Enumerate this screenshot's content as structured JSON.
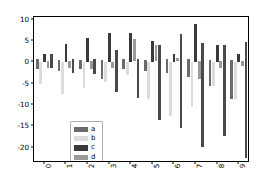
{
  "chart_data": {
    "type": "bar",
    "title": "",
    "xlabel": "",
    "ylabel": "",
    "categories": [
      "0",
      "1",
      "2",
      "3",
      "4",
      "5",
      "6",
      "7",
      "8",
      "9"
    ],
    "ylim": [
      -23.5,
      10.8
    ],
    "xlim": [
      -0.5,
      9.5
    ],
    "grid": false,
    "legend_position": "lower left",
    "y_ticks": [
      10,
      5,
      0,
      -5,
      -10,
      -15,
      -20
    ],
    "y_tick_labels": [
      "10",
      "5",
      "0",
      "-5",
      "-10",
      "-15",
      "-20"
    ],
    "x_ticks": [
      0,
      1,
      2,
      3,
      4,
      5,
      6,
      7,
      8,
      9
    ],
    "series": [
      {
        "name": "a",
        "color": "#6b6b6b",
        "values": [
          -1.5,
          -2.0,
          -1.5,
          -4.0,
          -1.5,
          -2.0,
          -2.5,
          -3.5,
          -5.5,
          -8.5
        ],
        "bases": [
          0.7,
          0.6,
          0.5,
          0.6,
          0.9,
          0.6,
          0.8,
          0.7,
          0.6,
          0.5
        ]
      },
      {
        "name": "b",
        "color": "#dcdcdc",
        "values": [
          -5.0,
          -7.5,
          -6.0,
          -4.5,
          -3.0,
          -8.5,
          -12.5,
          -10.5,
          -5.5,
          -8.5
        ],
        "bases": [
          0.0,
          0.2,
          0.0,
          0.0,
          0.0,
          0.0,
          0.0,
          0.0,
          0.0,
          0.0
        ]
      },
      {
        "name": "c",
        "color": "#3a3a3a",
        "values": [
          2.0,
          4.3,
          5.8,
          6.9,
          6.9,
          5.0,
          2.0,
          9.0,
          4.0,
          2.0
        ],
        "bases": [
          0.0,
          0.0,
          0.0,
          0.0,
          0.0,
          0.0,
          0.0,
          0.0,
          0.0,
          0.0
        ]
      },
      {
        "name": "d",
        "color": "#9a9a9a",
        "values": [
          -1.4,
          -1.2,
          -1.5,
          -1.3,
          5.4,
          4.2,
          1.0,
          -4.0,
          -1.2,
          -0.8
        ],
        "bases": [
          0.3,
          0.4,
          0.4,
          0.2,
          0.3,
          0.3,
          0.4,
          0.3,
          0.3,
          0.3
        ]
      },
      {
        "name": "e",
        "color": "#4a4a4a",
        "values": [
          -1.3,
          -2.4,
          -2.6,
          -7.0,
          -8.4,
          -13.5,
          -15.3,
          -19.8,
          -17.2,
          -22.4
        ],
        "bases": [
          1.9,
          0.9,
          0.8,
          3.0,
          0.7,
          4.0,
          6.8,
          4.6,
          4.0,
          4.8
        ]
      }
    ]
  },
  "legend": {
    "entries": [
      {
        "label": "a",
        "color": "#6b6b6b"
      },
      {
        "label": "b",
        "color": "#dcdcdc"
      },
      {
        "label": "c",
        "color": "#3a3a3a"
      },
      {
        "label": "d",
        "color": "#9a9a9a"
      },
      {
        "label": "e",
        "color": "#4a4a4a"
      }
    ]
  }
}
